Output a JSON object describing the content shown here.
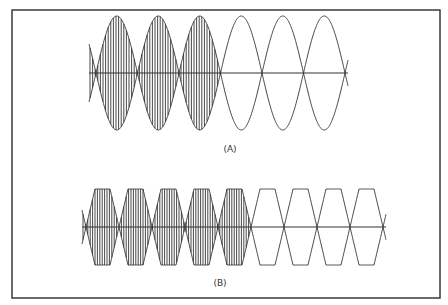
{
  "figure": {
    "frame_color": "#3a3a3a",
    "line_color": "#333333",
    "panels": [
      {
        "id": "A",
        "label": "(A)",
        "description": "Sinusoidal amplitude-modulated carrier; first three lobes filled with high-frequency carrier, remaining three lobes show envelope only",
        "envelope_shape": "sine",
        "lobes_total": 6,
        "lobes_filled": 3
      },
      {
        "id": "B",
        "label": "(B)",
        "description": "Trapezoidal (clipped) envelope modulated carrier; first five lobes filled with carrier, remaining four show envelope only",
        "envelope_shape": "trapezoid",
        "lobes_total": 8,
        "lobes_filled": 4
      }
    ]
  }
}
